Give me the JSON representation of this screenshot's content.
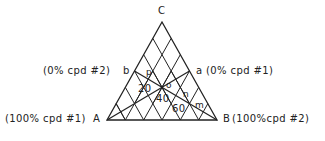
{
  "diagram": {
    "type": "ternary-phase-diagram",
    "vertices": {
      "A": {
        "label": "A",
        "annotation": "(100% cpd #1)"
      },
      "B": {
        "label": "B",
        "annotation": "(100%cpd #2)"
      },
      "C": {
        "label": "C"
      }
    },
    "side_points": {
      "a": {
        "label": "a",
        "annotation": "(0% cpd #1)"
      },
      "b": {
        "label": "b",
        "annotation": "(0% cpd #2)"
      }
    },
    "interior_points": [
      "p",
      "o",
      "n",
      "m"
    ],
    "grid_labels": [
      "20",
      "40",
      "60"
    ],
    "line_color": "#222222",
    "background": "#ffffff"
  }
}
